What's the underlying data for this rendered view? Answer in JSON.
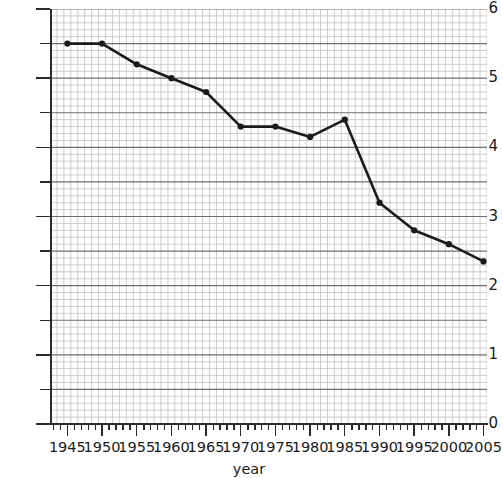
{
  "chart_data": {
    "type": "line",
    "title": "",
    "xlabel": "year",
    "ylabel": "",
    "x": [
      1945,
      1950,
      1955,
      1960,
      1965,
      1970,
      1975,
      1980,
      1985,
      1990,
      1995,
      2000,
      2005
    ],
    "values": [
      5.5,
      5.5,
      5.2,
      5.0,
      4.8,
      4.3,
      4.3,
      4.15,
      4.4,
      3.2,
      2.8,
      2.6,
      2.35
    ],
    "series": [
      {
        "name": "value",
        "values": [
          5.5,
          5.5,
          5.2,
          5.0,
          4.8,
          4.3,
          4.3,
          4.15,
          4.4,
          3.2,
          2.8,
          2.6,
          2.35
        ]
      }
    ],
    "xlim": [
      1942.5,
      2005.5
    ],
    "ylim": [
      0,
      6
    ],
    "x_ticks": [
      1945,
      1950,
      1955,
      1960,
      1965,
      1970,
      1975,
      1980,
      1985,
      1990,
      1995,
      2000,
      2005
    ],
    "x_tick_labels": [
      "1945",
      "1950",
      "1955",
      "1960",
      "1965",
      "1970",
      "1975",
      "1980",
      "1985",
      "1990",
      "1995",
      "2000",
      "2005"
    ],
    "y_ticks": [
      0,
      1,
      2,
      3,
      4,
      5,
      6
    ],
    "y_tick_labels": [
      "0",
      "1",
      "2",
      "3",
      "4",
      "5",
      "6"
    ],
    "y_minor_ticks": [
      0.5,
      1.5,
      2.5,
      3.5,
      4.5,
      5.5
    ],
    "grid": "on",
    "grid_style": "graph-paper minor and major rulings",
    "legend": "none",
    "marker": "filled-circle",
    "line_color": "#1a1a1a",
    "marker_color": "#1a1a1a",
    "grid_minor_color": "#b9b9b9",
    "grid_major_color": "#6f6f6f",
    "axis_color": "#2b2b2b"
  },
  "axes": {
    "x_title": "year",
    "y_title": ""
  }
}
